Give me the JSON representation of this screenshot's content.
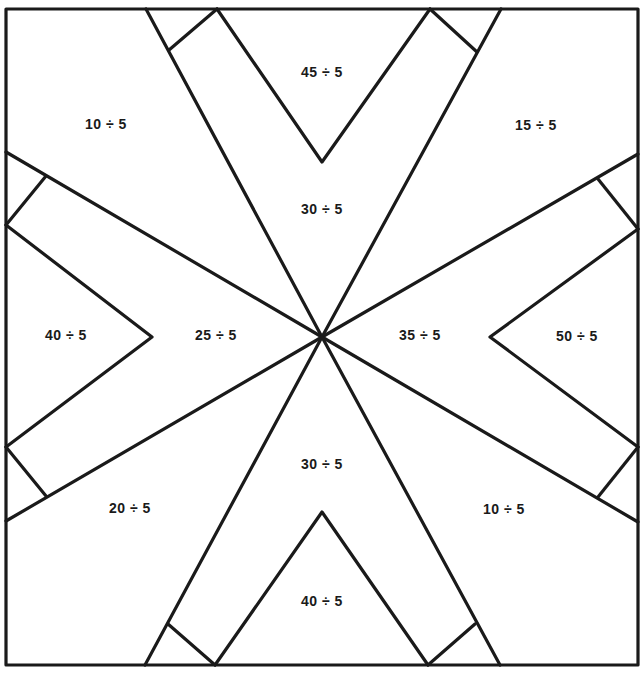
{
  "worksheet": {
    "line_color": "#1a1a1a",
    "regions": [
      {
        "id": "top-left",
        "label": "10 ÷ 5",
        "x": 106,
        "y": 124
      },
      {
        "id": "top-center",
        "label": "45 ÷ 5",
        "x": 322,
        "y": 72
      },
      {
        "id": "top-right",
        "label": "15 ÷ 5",
        "x": 536,
        "y": 125
      },
      {
        "id": "upper-center",
        "label": "30 ÷ 5",
        "x": 322,
        "y": 209
      },
      {
        "id": "left-outer",
        "label": "40 ÷ 5",
        "x": 66,
        "y": 335
      },
      {
        "id": "left-inner",
        "label": "25 ÷ 5",
        "x": 216,
        "y": 335
      },
      {
        "id": "right-inner",
        "label": "35 ÷ 5",
        "x": 420,
        "y": 335
      },
      {
        "id": "right-outer",
        "label": "50 ÷ 5",
        "x": 577,
        "y": 336
      },
      {
        "id": "lower-center",
        "label": "30 ÷ 5",
        "x": 322,
        "y": 464
      },
      {
        "id": "bottom-left",
        "label": "20 ÷ 5",
        "x": 130,
        "y": 508
      },
      {
        "id": "bottom-right",
        "label": "10 ÷ 5",
        "x": 504,
        "y": 509
      },
      {
        "id": "bottom-center",
        "label": "40 ÷ 5",
        "x": 322,
        "y": 601
      }
    ]
  }
}
